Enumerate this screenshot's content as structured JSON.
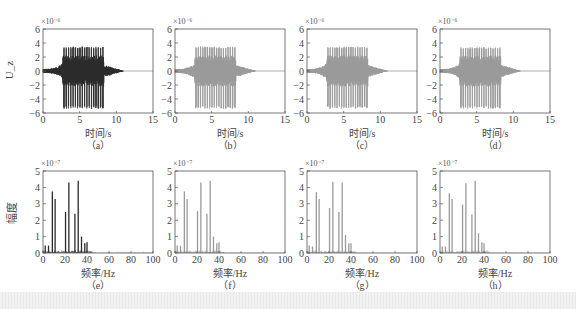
{
  "chart_data": [
    {
      "id": "a",
      "type": "line",
      "caption": "（a）",
      "title": "",
      "xlabel": "时间/s",
      "ylabel": "U_z",
      "y_exponent": "×10⁻⁶",
      "xlim": [
        0,
        15
      ],
      "ylim": [
        -6,
        6
      ],
      "xticks": [
        0,
        5,
        10,
        15
      ],
      "yticks": [
        -6,
        -4,
        -2,
        0,
        2,
        4,
        6
      ],
      "color": "#2b2b2b",
      "envelope": {
        "onset_s": 0,
        "burst_start_s": 2.7,
        "burst_end_s": 8.3,
        "decay_end_s": 11,
        "peak_pos": 3.5,
        "peak_neg": -5.4
      }
    },
    {
      "id": "b",
      "type": "line",
      "caption": "（b）",
      "title": "",
      "xlabel": "时间/s",
      "ylabel": "",
      "y_exponent": "×10⁻⁶",
      "xlim": [
        0,
        15
      ],
      "ylim": [
        -6,
        6
      ],
      "xticks": [
        0,
        5,
        10,
        15
      ],
      "yticks": [
        -6,
        -4,
        -2,
        0,
        2,
        4,
        6
      ],
      "color": "#9a9a9a",
      "envelope": {
        "onset_s": 0,
        "burst_start_s": 2.7,
        "burst_end_s": 8.3,
        "decay_end_s": 11,
        "peak_pos": 3.5,
        "peak_neg": -5.4
      }
    },
    {
      "id": "c",
      "type": "line",
      "caption": "（c）",
      "title": "",
      "xlabel": "时间/s",
      "ylabel": "",
      "y_exponent": "×10⁻⁶",
      "xlim": [
        0,
        15
      ],
      "ylim": [
        -6,
        6
      ],
      "xticks": [
        0,
        5,
        10,
        15
      ],
      "yticks": [
        -6,
        -4,
        -2,
        0,
        2,
        4,
        6
      ],
      "color": "#9a9a9a",
      "envelope": {
        "onset_s": 0,
        "burst_start_s": 2.7,
        "burst_end_s": 8.3,
        "decay_end_s": 11,
        "peak_pos": 3.5,
        "peak_neg": -5.4
      }
    },
    {
      "id": "d",
      "type": "line",
      "caption": "（d）",
      "title": "",
      "xlabel": "时间/s",
      "ylabel": "",
      "y_exponent": "×10⁻⁶",
      "xlim": [
        0,
        15
      ],
      "ylim": [
        -6,
        6
      ],
      "xticks": [
        0,
        5,
        10,
        15
      ],
      "yticks": [
        -6,
        -4,
        -2,
        0,
        2,
        4,
        6
      ],
      "color": "#9a9a9a",
      "envelope": {
        "onset_s": 0,
        "burst_start_s": 2.7,
        "burst_end_s": 8.3,
        "decay_end_s": 11,
        "peak_pos": 3.4,
        "peak_neg": -5.4
      }
    },
    {
      "id": "e",
      "type": "bar",
      "caption": "（e）",
      "title": "",
      "xlabel": "频率/Hz",
      "ylabel": "幅度",
      "y_exponent": "×10⁻⁷",
      "xlim": [
        0,
        100
      ],
      "ylim": [
        0,
        5
      ],
      "xticks": [
        0,
        20,
        40,
        60,
        80,
        100
      ],
      "yticks": [
        0,
        1,
        2,
        3,
        4,
        5
      ],
      "color": "#2b2b2b",
      "x": [
        2,
        5,
        8.5,
        11,
        20.5,
        23.5,
        29,
        32,
        35,
        38,
        40
      ],
      "values": [
        0.45,
        0.45,
        3.75,
        3.3,
        2.5,
        4.3,
        2.4,
        4.4,
        1.0,
        0.6,
        0.65
      ]
    },
    {
      "id": "f",
      "type": "bar",
      "caption": "（f）",
      "title": "",
      "xlabel": "频率/Hz",
      "ylabel": "",
      "y_exponent": "×10⁻⁷",
      "xlim": [
        0,
        100
      ],
      "ylim": [
        0,
        5
      ],
      "xticks": [
        0,
        20,
        40,
        60,
        80,
        100
      ],
      "yticks": [
        0,
        1,
        2,
        3,
        4,
        5
      ],
      "color": "#9a9a9a",
      "x": [
        2,
        5,
        8.5,
        11,
        20.5,
        23.5,
        29,
        32,
        35,
        38,
        40
      ],
      "values": [
        0.45,
        0.45,
        3.75,
        3.3,
        2.55,
        4.3,
        2.4,
        4.4,
        1.0,
        0.6,
        0.65
      ]
    },
    {
      "id": "g",
      "type": "bar",
      "caption": "（g）",
      "title": "",
      "xlabel": "频率/Hz",
      "ylabel": "",
      "y_exponent": "×10⁻⁷",
      "xlim": [
        0,
        100
      ],
      "ylim": [
        0,
        5
      ],
      "xticks": [
        0,
        20,
        40,
        60,
        80,
        100
      ],
      "yticks": [
        0,
        1,
        2,
        3,
        4,
        5
      ],
      "color": "#9a9a9a",
      "x": [
        2,
        5,
        8.5,
        11,
        20.5,
        23.5,
        29,
        32,
        35,
        38,
        40
      ],
      "values": [
        0.45,
        0.4,
        3.7,
        3.3,
        2.75,
        4.35,
        2.5,
        4.3,
        1.1,
        0.6,
        0.6
      ]
    },
    {
      "id": "h",
      "type": "bar",
      "caption": "（h）",
      "title": "",
      "xlabel": "频率/Hz",
      "ylabel": "",
      "y_exponent": "×10⁻⁷",
      "xlim": [
        0,
        100
      ],
      "ylim": [
        0,
        5
      ],
      "xticks": [
        0,
        20,
        40,
        60,
        80,
        100
      ],
      "yticks": [
        0,
        1,
        2,
        3,
        4,
        5
      ],
      "color": "#9a9a9a",
      "x": [
        2,
        5,
        8.5,
        11,
        20.5,
        23.5,
        29,
        32,
        35,
        38,
        40
      ],
      "values": [
        0.4,
        0.4,
        3.65,
        3.3,
        2.95,
        4.25,
        2.35,
        4.4,
        1.2,
        0.65,
        0.6
      ]
    }
  ]
}
